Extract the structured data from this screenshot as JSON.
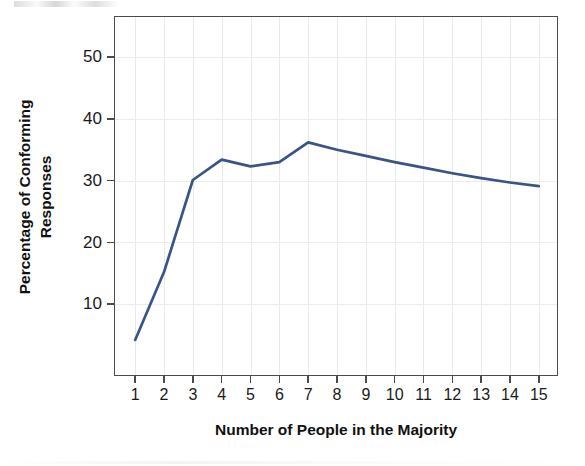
{
  "figure": {
    "background_color": "#ffffff",
    "line_color": "#3a5488",
    "axis_color": "#4b4b4b",
    "grid_color": "#e9e9ec"
  },
  "chart_data": {
    "type": "line",
    "title": "",
    "xlabel": "Number of People in the Majority",
    "ylabel": "Percentage of Conforming Responses",
    "x": [
      1,
      2,
      3,
      4,
      5,
      6,
      7,
      8,
      9,
      10,
      11,
      12,
      13,
      14,
      15
    ],
    "values": [
      4.2,
      15.2,
      30.1,
      33.4,
      32.3,
      33.0,
      36.2,
      35.0,
      34.0,
      33.0,
      32.1,
      31.2,
      30.4,
      29.7,
      29.1
    ],
    "xtick_labels": [
      "1",
      "2",
      "3",
      "4",
      "5",
      "6",
      "7",
      "8",
      "9",
      "10",
      "11",
      "12",
      "13",
      "14",
      "15"
    ],
    "ytick_labels": [
      "10",
      "20",
      "30",
      "40",
      "50"
    ],
    "ytick_values": [
      10,
      20,
      30,
      40,
      50
    ],
    "xlim": [
      0.3,
      15.7
    ],
    "ylim": [
      -1.8,
      56.5
    ],
    "grid": true,
    "legend": null,
    "series_name": "Percentage of Conforming Responses"
  }
}
